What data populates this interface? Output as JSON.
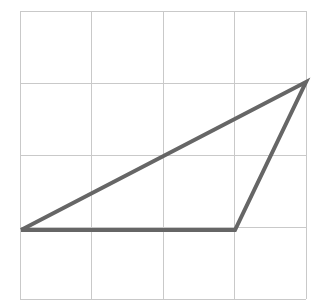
{
  "figure": {
    "canvas": {
      "width": 322,
      "height": 301,
      "background": "#ffffff"
    },
    "grid": {
      "label": "square grid",
      "color": "#c9c9c9",
      "stroke_width": 1,
      "origin_x": 20,
      "origin_y": 11,
      "cell_width": 71.5,
      "cell_height": 72,
      "columns": 4,
      "rows": 4,
      "x_lines": [
        20,
        91.5,
        163,
        234.5,
        306
      ],
      "y_lines": [
        11,
        83,
        155,
        227,
        299
      ],
      "x_extent": [
        20,
        306
      ],
      "y_extent": [
        11,
        299
      ]
    },
    "shape": {
      "name": "triangle",
      "type": "polygon",
      "fill": "none",
      "stroke": "#666666",
      "stroke_width": 4,
      "vertices": [
        {
          "name": "left-vertex",
          "x": 21,
          "y": 230,
          "grid_col": 0,
          "grid_row": 3
        },
        {
          "name": "bottom-right-vertex",
          "x": 235,
          "y": 230,
          "grid_col": 3,
          "grid_row": 3
        },
        {
          "name": "apex-vertex",
          "x": 306,
          "y": 82,
          "grid_col": 4,
          "grid_row": 1
        }
      ],
      "edges": [
        {
          "name": "base-edge",
          "from": "left-vertex",
          "to": "bottom-right-vertex"
        },
        {
          "name": "right-edge",
          "from": "bottom-right-vertex",
          "to": "apex-vertex"
        },
        {
          "name": "hypotenuse-edge",
          "from": "apex-vertex",
          "to": "left-vertex"
        }
      ],
      "points_string": "21,230 235,230 306,82"
    }
  }
}
